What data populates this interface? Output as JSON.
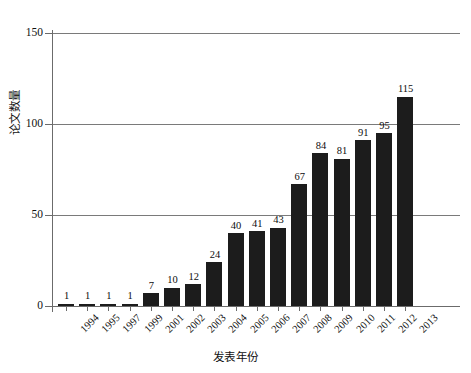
{
  "chart_data": {
    "type": "bar",
    "title": "",
    "xlabel": "发表年份",
    "ylabel": "论文数量",
    "categories": [
      "1994",
      "1995",
      "1997",
      "1999",
      "2001",
      "2002",
      "2003",
      "2004",
      "2005",
      "2006",
      "2007",
      "2008",
      "2009",
      "2010",
      "2011",
      "2012",
      "2013"
    ],
    "values": [
      1,
      1,
      1,
      1,
      7,
      10,
      12,
      24,
      40,
      41,
      43,
      67,
      84,
      81,
      91,
      95,
      115
    ],
    "ylim": [
      0,
      150
    ],
    "yticks": [
      0,
      50,
      100,
      150
    ],
    "ytick_labels": [
      "0",
      "50",
      "100",
      "150"
    ],
    "grid": true,
    "legend": "none",
    "bar_color": "#1c1c1c",
    "show_value_labels": true
  },
  "axes": {
    "y_title": "论文数量",
    "x_title": "发表年份"
  }
}
